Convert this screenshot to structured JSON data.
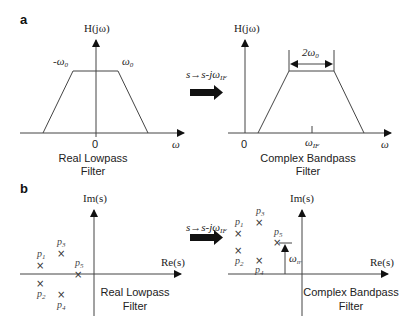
{
  "panel_a": {
    "letter": "a",
    "left": {
      "y_label": "H(jω)",
      "x_label": "ω",
      "origin_label": "0",
      "neg_cutoff": "-ω",
      "neg_cutoff_sub": "0",
      "pos_cutoff": "ω",
      "pos_cutoff_sub": "0",
      "caption_line1": "Real Lowpass",
      "caption_line2": "Filter"
    },
    "transform": {
      "label": "s→s-jω",
      "label_sub": "IF"
    },
    "right": {
      "y_label": "H(jω)",
      "x_label": "ω",
      "origin_label": "0",
      "center_label": "ω",
      "center_label_sub": "IF",
      "bandwidth_label": "2ω",
      "bandwidth_sub": "0",
      "caption_line1": "Complex Bandpass",
      "caption_line2": "Filter"
    }
  },
  "panel_b": {
    "letter": "b",
    "left": {
      "y_label": "Im(s)",
      "x_label": "Re(s)",
      "poles": [
        {
          "name": "p",
          "sub": "1"
        },
        {
          "name": "p",
          "sub": "2"
        },
        {
          "name": "p",
          "sub": "3"
        },
        {
          "name": "p",
          "sub": "4"
        },
        {
          "name": "p",
          "sub": "5"
        }
      ],
      "pole_marker": "×",
      "caption_line1": "Real Lowpass",
      "caption_line2": "Filter"
    },
    "transform": {
      "label": "s→s-jω",
      "label_sub": "IF"
    },
    "right": {
      "y_label": "Im(s)",
      "x_label": "Re(s)",
      "poles": [
        {
          "name": "p",
          "sub": "1"
        },
        {
          "name": "p",
          "sub": "2"
        },
        {
          "name": "p",
          "sub": "3"
        },
        {
          "name": "p",
          "sub": "4"
        },
        {
          "name": "p",
          "sub": "5"
        }
      ],
      "pole_marker": "×",
      "shift_label": "ω",
      "shift_sub": "IF",
      "caption_line1": "Complex Bandpass",
      "caption_line2": "Filter"
    }
  }
}
